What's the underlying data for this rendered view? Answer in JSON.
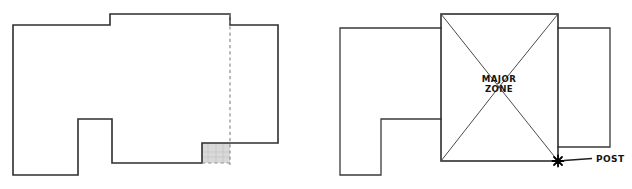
{
  "figure": {
    "background_color": "#ffffff",
    "line_color": "#2e2e2e",
    "dashed_line_color": "#8d8d8d",
    "shaded_fill_color": "#d9d9d9",
    "width": 632,
    "height": 189
  },
  "panels": [
    {
      "id": "left-panel",
      "name": "building-footprint-plan",
      "description": "Outline floor plan with dashed division line and small shaded corner bay",
      "labels": []
    },
    {
      "id": "right-panel",
      "name": "major-zone-plan",
      "description": "Same footprint with central square hip-roof zone and corner post callout",
      "labels": [
        {
          "key": "zone",
          "text_line_1": "MAJOR",
          "text_line_2": "ZONE"
        },
        {
          "key": "post",
          "text": "POST"
        }
      ]
    }
  ],
  "left_plan": {
    "name": "left-plan-outline",
    "outline_path": "M13,25 L110,25 L110,14 L230,14 L230,25 L278,25 L278,143 L202,143 L202,163 L112,163 L112,119 L78,119 L78,175 L13,175 Z",
    "dashed_divider_path": "M230,14 L230,163",
    "shaded_bay": {
      "x": 202,
      "y": 143,
      "width": 28,
      "height": 20
    }
  },
  "right_plan": {
    "name": "right-plan-outline",
    "west_wing_path": "M340,28 L441,28 L441,119 L381,119 L381,175 L340,175 Z",
    "east_wing_path": "M560,28 L610,28 L610,147 L560,147",
    "major_zone_square": {
      "x": 441,
      "y": 14,
      "width": 117,
      "height": 147
    },
    "hip_lines": [
      "M441,14 L499,87",
      "M558,14 L499,87",
      "M441,161 L499,87",
      "M558,161 L499,87"
    ],
    "zone_label_position": {
      "x": 499,
      "y": 82
    },
    "post_marker": {
      "x": 558,
      "y": 161
    },
    "post_leader_path": "M563,161 L592,159",
    "post_label_position": {
      "x": 596,
      "y": 163
    }
  },
  "annotations": {
    "zone_label_line_1": "MAJOR",
    "zone_label_line_2": "ZONE",
    "post_label": "POST"
  }
}
